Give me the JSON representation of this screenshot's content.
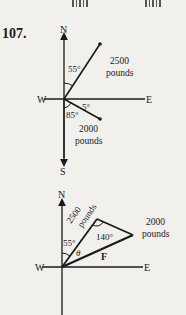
{
  "problem": {
    "number": "107."
  },
  "diagram1": {
    "directions": {
      "north": "N",
      "south": "S",
      "east": "E",
      "west": "W"
    },
    "vectors": [
      {
        "magnitude_line1": "2500",
        "magnitude_line2": "pounds",
        "angle_label": "55°",
        "description": "N 55° E"
      },
      {
        "magnitude_line1": "2000",
        "magnitude_line2": "pounds",
        "angle_label": "85°",
        "secondary_angle_label": "5°",
        "description": "S 85° E (5° below E)"
      }
    ]
  },
  "diagram2": {
    "directions": {
      "north": "N",
      "east": "E",
      "west": "W"
    },
    "labels": {
      "force_a_line1": "2500",
      "force_a_line2": "pounds",
      "force_b_line1": "2000",
      "force_b_line2": "pounds",
      "angle_north": "55°",
      "angle_vertex": "140°",
      "theta": "θ",
      "resultant": "F"
    }
  },
  "colors": {
    "ink": "#1a1a1a",
    "paper": "#f1f0ed"
  }
}
